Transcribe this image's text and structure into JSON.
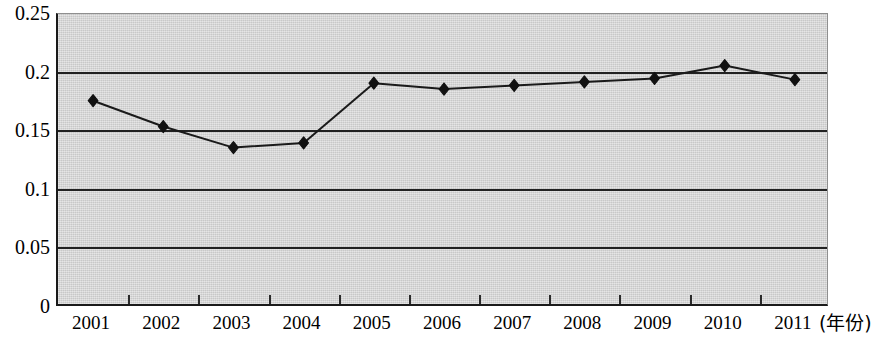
{
  "chart_data": {
    "type": "line",
    "title": "",
    "subtitle": "",
    "xlabel": "(年份)",
    "ylabel": "",
    "categories": [
      "2001",
      "2002",
      "2003",
      "2004",
      "2005",
      "2006",
      "2007",
      "2008",
      "2009",
      "2010",
      "2011"
    ],
    "values": [
      0.176,
      0.154,
      0.136,
      0.14,
      0.191,
      0.186,
      0.189,
      0.192,
      0.195,
      0.206,
      0.194
    ],
    "series": [
      {
        "name": "",
        "values": [
          0.176,
          0.154,
          0.136,
          0.14,
          0.191,
          0.186,
          0.189,
          0.192,
          0.195,
          0.206,
          0.194
        ]
      }
    ],
    "ylim": [
      0,
      0.25
    ],
    "y_ticks": [
      0,
      0.05,
      0.1,
      0.15,
      0.2,
      0.25
    ],
    "y_tick_labels": [
      "0",
      "0.05",
      "0.1",
      "0.15",
      "0.2",
      "0.25"
    ],
    "gridlines": [
      0.05,
      0.1,
      0.15,
      0.2
    ],
    "grid": true,
    "legend": false,
    "legend_position": "none",
    "annotations": [],
    "marker": "diamond",
    "colors": {
      "plot_background": "#d5d5d5",
      "line": "#1a1a1a",
      "marker": "#111111",
      "gridline": "#222222",
      "axis": "#1a1a1a",
      "text": "#000000",
      "page_background": "#ffffff"
    }
  },
  "axes": {
    "x_unit_label": "(年份)"
  }
}
